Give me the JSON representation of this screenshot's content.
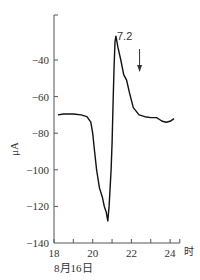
{
  "chart_data": {
    "type": "line",
    "title": "",
    "xlabel": "时",
    "xlabel_secondary": "8月16日",
    "ylabel": "μA",
    "xlim": [
      18,
      24.5
    ],
    "ylim": [
      -140,
      -28
    ],
    "grid": false,
    "x_ticks": [
      18,
      20,
      22,
      24
    ],
    "x_minor_ticks": [
      19,
      21,
      23
    ],
    "y_ticks": [
      -40,
      -60,
      -80,
      -100,
      -120,
      -140
    ],
    "series": [
      {
        "name": "current",
        "x": [
          18.2,
          18.5,
          19.0,
          19.4,
          19.7,
          19.9,
          20.0,
          20.1,
          20.2,
          20.35,
          20.5,
          20.6,
          20.7,
          20.78,
          20.85,
          20.9,
          20.95,
          21.0,
          21.05,
          21.1,
          21.15,
          21.2,
          21.3,
          21.45,
          21.6,
          21.75,
          21.9,
          22.1,
          22.4,
          22.7,
          23.0,
          23.3,
          23.45,
          23.6,
          23.8,
          24.0,
          24.2
        ],
        "y": [
          -70,
          -69.5,
          -69.5,
          -70,
          -71,
          -74,
          -80,
          -90,
          -100,
          -110,
          -115,
          -120,
          -123,
          -128,
          -120,
          -110,
          -100,
          -85,
          -65,
          -45,
          -30,
          -27,
          -33,
          -40,
          -48,
          -51,
          -58,
          -66,
          -70,
          -71,
          -71.5,
          -71.5,
          -72.5,
          -73.5,
          -74,
          -73.5,
          -72
        ]
      }
    ],
    "annotations": [
      {
        "text": "7.2",
        "x": 22.5,
        "y": -33,
        "type": "down-arrow",
        "arrow_from_y": -34,
        "arrow_to_y": -46
      }
    ]
  },
  "labels": {
    "ylabel": "μA",
    "date": "8月16日",
    "unit": "时",
    "annotation": "7.2"
  }
}
